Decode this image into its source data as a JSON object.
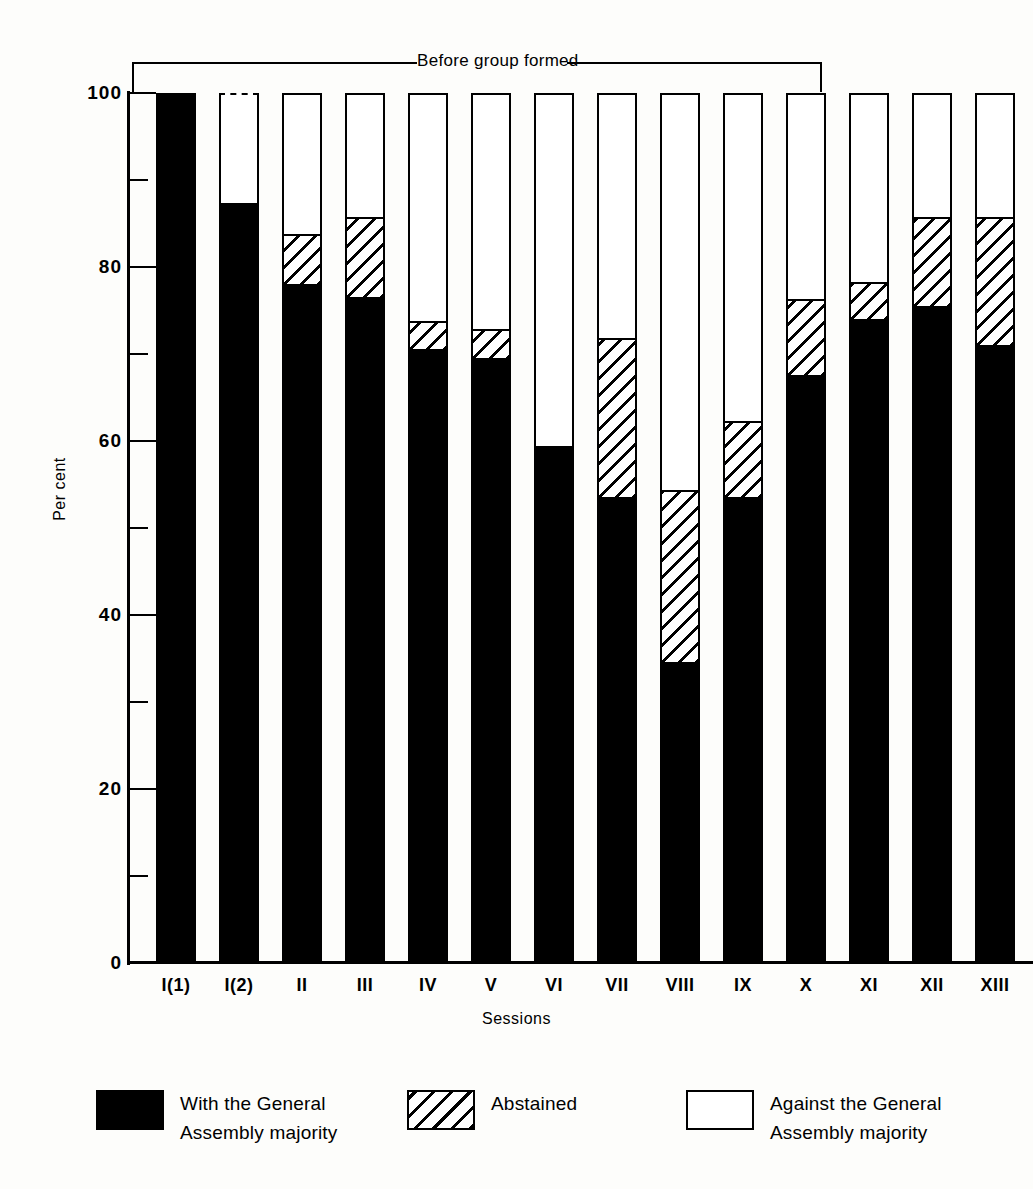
{
  "chart_data": {
    "type": "bar",
    "stacked": true,
    "title": "",
    "xlabel": "Sessions",
    "ylabel": "Per cent",
    "ylim": [
      0,
      100
    ],
    "ytick_major": [
      0,
      20,
      40,
      60,
      80,
      100
    ],
    "ytick_minor": [
      10,
      30,
      50,
      70,
      90
    ],
    "ytick_labels": [
      "0",
      "20",
      "40",
      "60",
      "80",
      "100"
    ],
    "grid": false,
    "legend_position": "bottom",
    "categories": [
      "I(1)",
      "I(2)",
      "II",
      "III",
      "IV",
      "V",
      "VI",
      "VII",
      "VIII",
      "IX",
      "X",
      "XI",
      "XII",
      "XIII"
    ],
    "series": [
      {
        "name": "With the General Assembly majority",
        "fill": "solid-black",
        "color": "#000000",
        "values": [
          100,
          87.5,
          78,
          76.5,
          70.5,
          69.5,
          59.5,
          53.5,
          34.5,
          53.5,
          67.5,
          74,
          75.5,
          71
        ]
      },
      {
        "name": "Abstained",
        "fill": "diagonal-hatch",
        "color": "#ffffff",
        "values": [
          0,
          0,
          6,
          9.5,
          3.5,
          3.5,
          0,
          18.5,
          20,
          9,
          9,
          4.5,
          10.5,
          15
        ]
      },
      {
        "name": "Against the General Assembly majority",
        "fill": "white",
        "color": "#ffffff",
        "values": [
          0,
          12.5,
          16,
          14,
          26,
          27,
          40.5,
          28,
          45.5,
          37.5,
          23.5,
          21.5,
          14,
          14
        ]
      }
    ],
    "cumulative_tops": {
      "with": [
        100,
        87.5,
        78,
        76.5,
        70.5,
        69.5,
        59.5,
        53.5,
        34.5,
        53.5,
        67.5,
        74,
        75.5,
        71
      ],
      "with_plus_abstained": [
        100,
        87.5,
        84,
        86,
        74,
        73,
        59.5,
        72,
        54.5,
        62.5,
        76.5,
        78.5,
        86,
        86
      ]
    },
    "annotations": [
      {
        "type": "bracket",
        "text": "Before group formed",
        "spans_categories": [
          "I(1)",
          "X"
        ]
      }
    ],
    "notes": [
      "Bar I(2) has a dashed (broken) top border."
    ]
  },
  "axes": {
    "y_title": "Per cent",
    "x_title": "Sessions"
  },
  "legend": {
    "items": [
      {
        "id": "with",
        "swatch": "solid",
        "line1": "With the General",
        "line2": "Assembly majority"
      },
      {
        "id": "abstained",
        "swatch": "hatch",
        "line1": "Abstained",
        "line2": ""
      },
      {
        "id": "against",
        "swatch": "white",
        "line1": "Against the General",
        "line2": "Assembly majority"
      }
    ]
  },
  "annotation": {
    "bracket_label": "Before group formed"
  },
  "colors": {
    "ink": "#000000",
    "paper": "#fdfdfb"
  }
}
